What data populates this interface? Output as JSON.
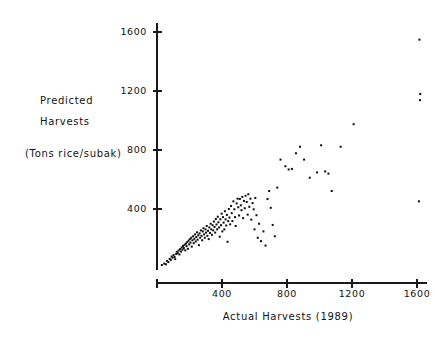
{
  "chart_data": {
    "type": "scatter",
    "title": "",
    "xlabel": "Actual Harvests   (1989)",
    "ylabel_line1": "Predicted",
    "ylabel_line2": "Harvests",
    "ylabel_units": "(Tons rice/subak)",
    "xlim": [
      0,
      1700
    ],
    "ylim": [
      0,
      1700
    ],
    "xticks": [
      400,
      800,
      1200,
      1600
    ],
    "xtick_labels": [
      "400",
      "800",
      "1200",
      "1600"
    ],
    "yticks": [
      400,
      800,
      1200,
      1600
    ],
    "ytick_labels": [
      "400",
      "800",
      "1200",
      "1600"
    ],
    "grid": false,
    "legend": null,
    "marker": "square",
    "marker_color": "#0d0d0d",
    "marker_size_px": 2,
    "n_points": 152,
    "points": [
      [
        30,
        20
      ],
      [
        45,
        30
      ],
      [
        55,
        25
      ],
      [
        62,
        48
      ],
      [
        70,
        40
      ],
      [
        78,
        62
      ],
      [
        85,
        55
      ],
      [
        90,
        78
      ],
      [
        96,
        70
      ],
      [
        102,
        88
      ],
      [
        108,
        75
      ],
      [
        112,
        60
      ],
      [
        118,
        95
      ],
      [
        122,
        110
      ],
      [
        128,
        100
      ],
      [
        133,
        118
      ],
      [
        138,
        92
      ],
      [
        142,
        128
      ],
      [
        148,
        112
      ],
      [
        152,
        140
      ],
      [
        157,
        125
      ],
      [
        160,
        150
      ],
      [
        165,
        135
      ],
      [
        170,
        158
      ],
      [
        174,
        120
      ],
      [
        178,
        165
      ],
      [
        182,
        148
      ],
      [
        186,
        175
      ],
      [
        190,
        130
      ],
      [
        194,
        185
      ],
      [
        198,
        160
      ],
      [
        202,
        195
      ],
      [
        206,
        172
      ],
      [
        210,
        205
      ],
      [
        214,
        145
      ],
      [
        218,
        188
      ],
      [
        222,
        215
      ],
      [
        226,
        168
      ],
      [
        230,
        198
      ],
      [
        234,
        228
      ],
      [
        238,
        180
      ],
      [
        242,
        210
      ],
      [
        246,
        242
      ],
      [
        250,
        192
      ],
      [
        254,
        222
      ],
      [
        258,
        155
      ],
      [
        262,
        235
      ],
      [
        266,
        205
      ],
      [
        270,
        255
      ],
      [
        274,
        218
      ],
      [
        278,
        188
      ],
      [
        282,
        248
      ],
      [
        286,
        270
      ],
      [
        290,
        228
      ],
      [
        294,
        205
      ],
      [
        298,
        262
      ],
      [
        302,
        240
      ],
      [
        306,
        285
      ],
      [
        310,
        218
      ],
      [
        314,
        252
      ],
      [
        318,
        196
      ],
      [
        322,
        275
      ],
      [
        326,
        238
      ],
      [
        330,
        300
      ],
      [
        334,
        262
      ],
      [
        338,
        225
      ],
      [
        342,
        290
      ],
      [
        346,
        255
      ],
      [
        350,
        315
      ],
      [
        354,
        278
      ],
      [
        358,
        240
      ],
      [
        362,
        332
      ],
      [
        366,
        295
      ],
      [
        370,
        262
      ],
      [
        374,
        348
      ],
      [
        378,
        310
      ],
      [
        382,
        275
      ],
      [
        386,
        212
      ],
      [
        390,
        330
      ],
      [
        394,
        290
      ],
      [
        398,
        368
      ],
      [
        402,
        248
      ],
      [
        406,
        345
      ],
      [
        410,
        308
      ],
      [
        414,
        262
      ],
      [
        418,
        385
      ],
      [
        422,
        330
      ],
      [
        426,
        288
      ],
      [
        430,
        360
      ],
      [
        434,
        178
      ],
      [
        438,
        318
      ],
      [
        442,
        400
      ],
      [
        446,
        342
      ],
      [
        450,
        296
      ],
      [
        456,
        420
      ],
      [
        460,
        372
      ],
      [
        464,
        318
      ],
      [
        470,
        452
      ],
      [
        476,
        398
      ],
      [
        480,
        345
      ],
      [
        484,
        285
      ],
      [
        490,
        438
      ],
      [
        496,
        470
      ],
      [
        500,
        412
      ],
      [
        505,
        356
      ],
      [
        510,
        468
      ],
      [
        516,
        425
      ],
      [
        520,
        392
      ],
      [
        525,
        482
      ],
      [
        530,
        338
      ],
      [
        535,
        455
      ],
      [
        540,
        405
      ],
      [
        545,
        490
      ],
      [
        552,
        448
      ],
      [
        558,
        362
      ],
      [
        562,
        500
      ],
      [
        568,
        415
      ],
      [
        575,
        470
      ],
      [
        580,
        328
      ],
      [
        588,
        440
      ],
      [
        595,
        398
      ],
      [
        600,
        262
      ],
      [
        605,
        475
      ],
      [
        612,
        358
      ],
      [
        620,
        205
      ],
      [
        628,
        300
      ],
      [
        640,
        182
      ],
      [
        655,
        248
      ],
      [
        668,
        152
      ],
      [
        680,
        468
      ],
      [
        690,
        522
      ],
      [
        700,
        408
      ],
      [
        712,
        292
      ],
      [
        725,
        215
      ],
      [
        740,
        545
      ],
      [
        760,
        735
      ],
      [
        790,
        690
      ],
      [
        810,
        668
      ],
      [
        830,
        672
      ],
      [
        855,
        778
      ],
      [
        880,
        822
      ],
      [
        905,
        735
      ],
      [
        940,
        612
      ],
      [
        985,
        648
      ],
      [
        1010,
        832
      ],
      [
        1035,
        655
      ],
      [
        1055,
        640
      ],
      [
        1075,
        522
      ],
      [
        1130,
        822
      ],
      [
        1210,
        975
      ],
      [
        1615,
        1548
      ],
      [
        1620,
        1180
      ],
      [
        1618,
        1138
      ],
      [
        1612,
        452
      ]
    ]
  }
}
